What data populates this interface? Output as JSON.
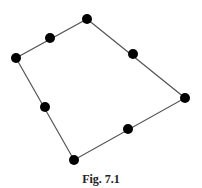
{
  "figure": {
    "caption": "Fig. 7.1",
    "line_color": "#555555",
    "dot_color": "#000000",
    "vertices": [
      {
        "name": "top",
        "x": 87,
        "y": 19
      },
      {
        "name": "right",
        "x": 185,
        "y": 98
      },
      {
        "name": "bottom",
        "x": 74,
        "y": 160
      },
      {
        "name": "left",
        "x": 16,
        "y": 58
      }
    ],
    "midpoints": [
      {
        "name": "mid-top-right",
        "x": 133,
        "y": 54
      },
      {
        "name": "mid-right-bottom",
        "x": 128,
        "y": 129
      },
      {
        "name": "mid-bottom-left",
        "x": 45,
        "y": 107
      },
      {
        "name": "mid-left-top",
        "x": 50,
        "y": 38
      }
    ]
  }
}
